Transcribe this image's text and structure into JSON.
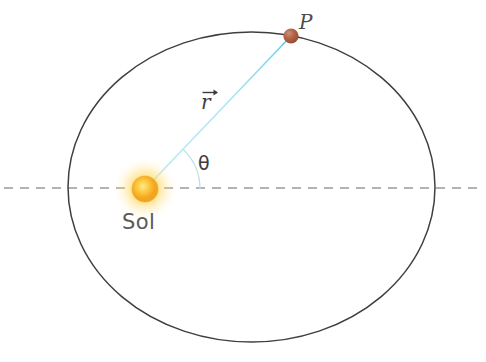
{
  "figure": {
    "name": "kepler-orbit-diagram",
    "background_color": "#ffffff",
    "width": 486,
    "height": 362
  },
  "labels": {
    "sun": "Sol",
    "point": "P",
    "radius_vector": "r",
    "angle": "θ"
  },
  "colors": {
    "orbit_stroke": "#3f3f41",
    "axis_dash": "#9a9a9c",
    "radius_line": "#a8e4ef",
    "radius_line_bright": "#6fd4ea",
    "angle_arc": "#b7e3e8",
    "sun_core": "#f5a623",
    "sun_mid": "#fbd24b",
    "sun_glow": "#fde79a",
    "planet": "#a9583c",
    "planet_highlight": "#c98a6e",
    "text": "#58585a"
  },
  "geometry": {
    "orbit": {
      "type": "ellipse",
      "cx": 251.5,
      "cy": 187,
      "rx": 183.5,
      "ry": 155,
      "stroke_width": 1.5
    },
    "major_axis": {
      "type": "dashed-line",
      "x1": 4,
      "y1": 188,
      "x2": 482,
      "y2": 188,
      "dash": "9 7",
      "stroke_width": 1.3
    },
    "sun": {
      "cx": 145,
      "cy": 189,
      "core_radius": 13,
      "glow_radius": 32
    },
    "point_p": {
      "cx": 291,
      "cy": 36,
      "radius": 7.5
    },
    "radius_vector": {
      "x1": 145,
      "y1": 189,
      "x2": 291,
      "y2": 36,
      "stroke_width": 1.6
    },
    "angle_arc": {
      "cx": 145,
      "cy": 189,
      "radius": 55,
      "start_deg": 0,
      "end_deg": 46,
      "stroke_width": 1.2
    }
  }
}
